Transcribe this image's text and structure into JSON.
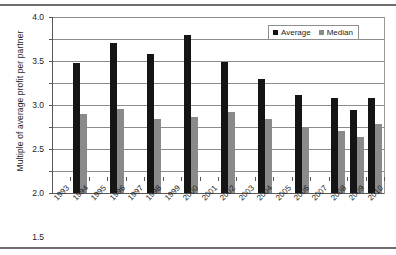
{
  "chart_data": {
    "type": "bar",
    "title": "",
    "subtitle": "",
    "xlabel": "",
    "ylabel": "Multiple of average profit per partner",
    "ylim": [
      0.0,
      4.0
    ],
    "ytick_step": 0.5,
    "ytick_labels": [
      "0.0",
      "0.5",
      "1.0",
      "1.5",
      "2.0",
      "2.5",
      "3.0",
      "3.5",
      "4.0"
    ],
    "ytick_values": [
      0.0,
      0.5,
      1.0,
      1.5,
      2.0,
      2.5,
      3.0,
      3.5,
      4.0
    ],
    "grid": true,
    "grid_axis": "y",
    "legend_position": "top-right",
    "categories": [
      "1993",
      "1994",
      "1995",
      "1996",
      "1997",
      "1998",
      "1999",
      "2000",
      "2001",
      "2002",
      "2003",
      "2004",
      "2005",
      "2006",
      "2007",
      "2008",
      "2009",
      "2010"
    ],
    "series": [
      {
        "name": "Average",
        "color": "#151515",
        "values": [
          null,
          2.95,
          null,
          3.4,
          null,
          3.17,
          null,
          3.58,
          null,
          2.98,
          null,
          2.6,
          null,
          2.22,
          null,
          2.15,
          1.88,
          2.15
        ]
      },
      {
        "name": "Median",
        "color": "#8a8a8a",
        "values": [
          null,
          1.8,
          null,
          1.9,
          null,
          1.68,
          null,
          1.72,
          null,
          1.84,
          null,
          1.68,
          null,
          1.5,
          null,
          1.4,
          1.28,
          1.56
        ]
      }
    ]
  },
  "legend": {
    "items": [
      {
        "label": "Average",
        "swatch": "black-square-swatch"
      },
      {
        "label": "Median",
        "swatch": "gray-square-swatch"
      }
    ]
  },
  "axes": {
    "y_title": "Multiple of average profit per partner"
  }
}
